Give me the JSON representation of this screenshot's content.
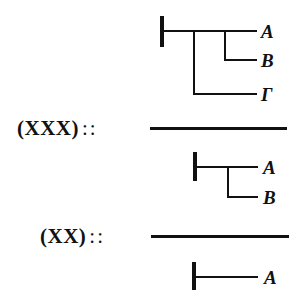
{
  "figure": {
    "stroke_color": "#111111",
    "background_color": "#ffffff"
  },
  "premise_1": {
    "formula_leaves": [
      {
        "label": "A",
        "role": "consequent"
      },
      {
        "label": "B",
        "role": "condition"
      },
      {
        "label": "Γ",
        "role": "condition"
      }
    ]
  },
  "inference_1": {
    "label": "(XXX)",
    "separator": "::"
  },
  "premise_2": {
    "formula_leaves": [
      {
        "label": "A",
        "role": "consequent"
      },
      {
        "label": "B",
        "role": "condition"
      }
    ]
  },
  "inference_2": {
    "label": "(XX)",
    "separator": "::"
  },
  "conclusion": {
    "formula_leaves": [
      {
        "label": "A",
        "role": "assertion"
      }
    ]
  }
}
